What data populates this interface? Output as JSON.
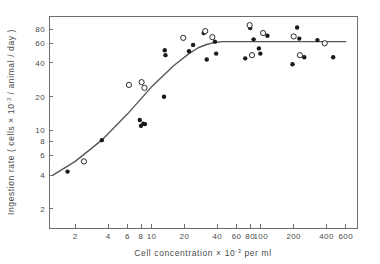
{
  "chart_data": {
    "type": "scatter",
    "title": "",
    "xlabel": "Cell concentration  × 10⁻³   per  ml",
    "ylabel": "Ingestion rate ( cells × 10⁻³ / animal / day )",
    "xscale": "log",
    "yscale": "log",
    "xlim": [
      1.15,
      760
    ],
    "ylim": [
      1.35,
      105
    ],
    "grid": false,
    "legend": null,
    "xticks": [
      2,
      4,
      6,
      8,
      10,
      20,
      40,
      60,
      80,
      100,
      200,
      400,
      600
    ],
    "xtick_labels": [
      "2",
      "4",
      "6",
      "8",
      "10",
      "20",
      "40",
      "60",
      "80",
      "100",
      "200",
      "400",
      "600"
    ],
    "yticks": [
      2,
      4,
      6,
      8,
      10,
      20,
      40,
      60,
      80
    ],
    "ytick_labels": [
      "2",
      "4",
      "6",
      "8",
      "10",
      "20",
      "40",
      "60",
      "80"
    ],
    "series": [
      {
        "name": "filled-circles",
        "marker": "filled-circle",
        "color": "#1a1a1a",
        "points": [
          [
            1.7,
            4.3
          ],
          [
            3.5,
            8.2
          ],
          [
            7.8,
            12.4
          ],
          [
            8.0,
            11.0
          ],
          [
            8.4,
            11.5
          ],
          [
            8.7,
            11.4
          ],
          [
            13.0,
            20.0
          ],
          [
            13.2,
            52.0
          ],
          [
            13.4,
            47.0
          ],
          [
            22.0,
            51.0
          ],
          [
            24.0,
            58.0
          ],
          [
            30.0,
            74.0
          ],
          [
            32.0,
            43.0
          ],
          [
            38.0,
            62.0
          ],
          [
            39.0,
            48.5
          ],
          [
            72.0,
            44.0
          ],
          [
            80.0,
            82.0
          ],
          [
            86.0,
            65.0
          ],
          [
            96.0,
            54.0
          ],
          [
            99.0,
            48.5
          ],
          [
            115.0,
            70.0
          ],
          [
            195.0,
            39.0
          ],
          [
            215.0,
            83.0
          ],
          [
            225.0,
            66.0
          ],
          [
            250.0,
            45.0
          ],
          [
            330.0,
            64.0
          ],
          [
            460.0,
            45.0
          ]
        ]
      },
      {
        "name": "open-circles",
        "marker": "open-circle",
        "color": "#ffffff",
        "points": [
          [
            2.4,
            5.3
          ],
          [
            6.2,
            25.5
          ],
          [
            8.1,
            27.0
          ],
          [
            8.6,
            24.0
          ],
          [
            19.5,
            67.0
          ],
          [
            31.0,
            77.0
          ],
          [
            36.0,
            68.0
          ],
          [
            79.0,
            87.0
          ],
          [
            83.0,
            47.0
          ],
          [
            105.0,
            74.0
          ],
          [
            200.0,
            69.0
          ],
          [
            228.0,
            47.0
          ],
          [
            385.0,
            60.0
          ]
        ]
      }
    ],
    "fit_curve": {
      "name": "two-phase-fit",
      "description": "Rising log-linear segment saturating to a plateau",
      "color": "#585858",
      "plateau_value": 62,
      "breakpoint_x": 45,
      "points": [
        [
          1.25,
          4.0
        ],
        [
          2.0,
          5.3
        ],
        [
          3.5,
          8.2
        ],
        [
          6.0,
          14.0
        ],
        [
          10.0,
          24.5
        ],
        [
          16.0,
          38.0
        ],
        [
          22.0,
          48.5
        ],
        [
          27.0,
          55.0
        ],
        [
          32.0,
          58.5
        ],
        [
          38.0,
          61.0
        ],
        [
          45.0,
          62.0
        ],
        [
          80.0,
          62.0
        ],
        [
          200.0,
          62.0
        ],
        [
          600.0,
          62.0
        ]
      ]
    }
  }
}
